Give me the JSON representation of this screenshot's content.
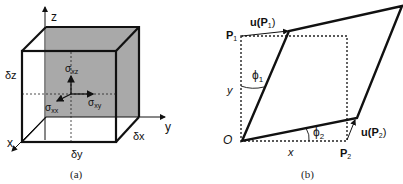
{
  "panel_a": {
    "caption": "(a)",
    "axes": {
      "z": "z",
      "y": "y",
      "x": "x"
    },
    "dimensions": {
      "dz": "δz",
      "dy": "δy",
      "dx": "δx"
    },
    "stresses": {
      "sxz": {
        "base": "σ",
        "sub": "xz"
      },
      "sxy": {
        "base": "σ",
        "sub": "xy"
      },
      "sxx": {
        "base": "σ",
        "sub": "xx"
      }
    },
    "colors": {
      "shade": "#a9a9a9",
      "line": "#111111"
    }
  },
  "panel_b": {
    "caption": "(b)",
    "origin": "O",
    "p1": {
      "base": "P",
      "sub": "1"
    },
    "p2": {
      "base": "P",
      "sub": "2"
    },
    "u_p1": {
      "pre": "u(",
      "base": "P",
      "sub": "1",
      "post": ")"
    },
    "u_p2": {
      "pre": "u(",
      "base": "P",
      "sub": "2",
      "post": ")"
    },
    "phi1": {
      "base": "ϕ",
      "sub": "1"
    },
    "phi2": {
      "base": "ϕ",
      "sub": "2"
    },
    "x_label": "x",
    "y_label": "y"
  }
}
